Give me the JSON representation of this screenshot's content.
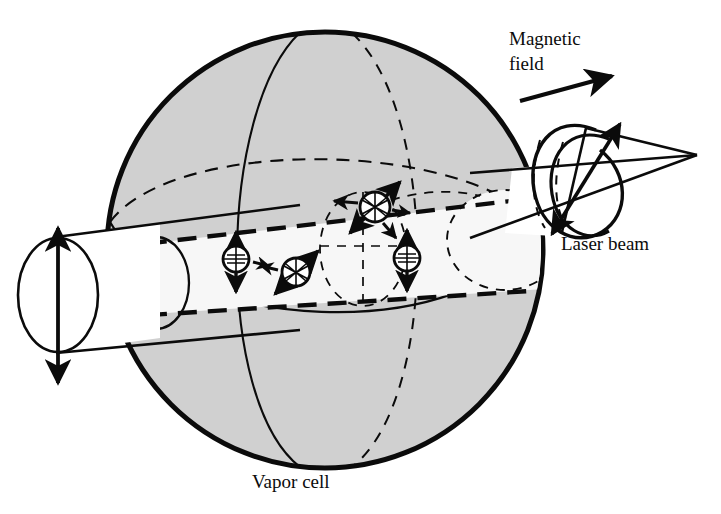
{
  "figure": {
    "kind": "schematic-diagram",
    "background_color": "#ffffff",
    "ink_color": "#0b0b0b"
  },
  "labels": {
    "magnetic_field_line1": "Magnetic",
    "magnetic_field_line2": "field",
    "laser_beam": "Laser beam",
    "vapor_cell": "Vapor cell"
  },
  "sphere": {
    "name": "vapor cell",
    "fill_color": "#d0d0d0",
    "outline_color": "#0b0b0b",
    "center_x": 325,
    "center_y": 250,
    "radius": 220,
    "outline_width": 5
  },
  "beam": {
    "name": "laser beam",
    "fill_color": "#f6f6f6",
    "polarization_left": "linear",
    "polarization_right": "circular",
    "direction": "left to right"
  },
  "magnetic_field_arrow": {
    "from_x": 520,
    "from_y": 101,
    "to_x": 612,
    "to_y": 76,
    "style": "solid-filled-arrow"
  },
  "atoms": [
    {
      "id": "atom-1",
      "cx": 236,
      "cy": 259,
      "r": 13,
      "pattern": "cross-hatch",
      "arrow": "vertical-double",
      "angle_deg": 90
    },
    {
      "id": "atom-2",
      "cx": 296,
      "cy": 272,
      "r": 14,
      "pattern": "star",
      "arrow": "diagonal-double",
      "angle_deg": 45
    },
    {
      "id": "atom-3",
      "cx": 375,
      "cy": 207,
      "r": 15,
      "pattern": "star",
      "arrow": "diagonal-double",
      "angle_deg": 45
    },
    {
      "id": "atom-4",
      "cx": 407,
      "cy": 258,
      "r": 13,
      "pattern": "cross-hatch",
      "arrow": "vertical-double",
      "angle_deg": 90
    }
  ],
  "label_positions": {
    "magnetic_field": {
      "x": 509,
      "y": 45
    },
    "laser_beam": {
      "x": 561,
      "y": 250
    },
    "vapor_cell": {
      "x": 252,
      "y": 488
    }
  }
}
